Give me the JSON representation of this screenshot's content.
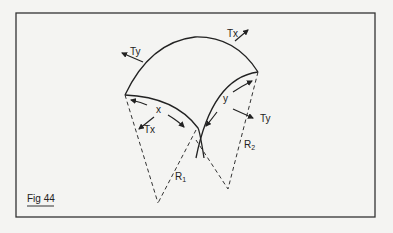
{
  "figure": {
    "caption": "Fig 44",
    "colors": {
      "background": "#f4f4f2",
      "ink": "#222222",
      "frame": "#333333"
    },
    "labels": {
      "ty_top": "Ty",
      "tx_top": "Tx",
      "x": "x",
      "tx_left": "Tx",
      "y": "y",
      "ty_right": "Ty",
      "r1_main": "R",
      "r1_sub": "1",
      "r2_main": "R",
      "r2_sub": "2"
    }
  }
}
